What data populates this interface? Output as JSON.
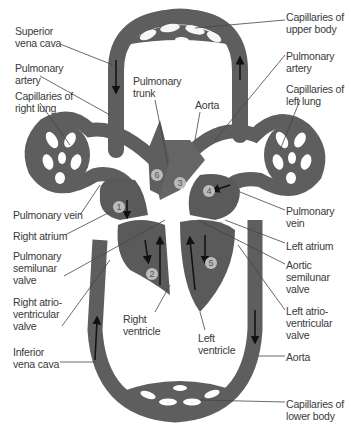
{
  "diagram": {
    "colors": {
      "vessel": "#5e5e5e",
      "vessel_outline": "#3e3e3e",
      "heart": "#5a5a5a",
      "background": "#ffffff",
      "label_text": "#3a3a3a",
      "leader_line": "#444444"
    },
    "labels_left": [
      {
        "id": "superior-vena-cava",
        "text": "Superior\nvena cava"
      },
      {
        "id": "pulmonary-artery-right",
        "text": "Pulmonary\nartery"
      },
      {
        "id": "capillaries-right-lung",
        "text": "Capillaries of\nright lung"
      },
      {
        "id": "pulmonary-vein-right",
        "text": "Pulmonary vein"
      },
      {
        "id": "right-atrium",
        "text": "Right atrium"
      },
      {
        "id": "pulmonary-semilunar-valve",
        "text": "Pulmonary\nsemilunar\nvalve"
      },
      {
        "id": "right-av-valve",
        "text": "Right atrio-\nventricular\nvalve"
      },
      {
        "id": "inferior-vena-cava",
        "text": "Inferior\nvena cava"
      }
    ],
    "labels_right": [
      {
        "id": "capillaries-upper-body",
        "text": "Capillaries of\nupper body"
      },
      {
        "id": "pulmonary-artery-left",
        "text": "Pulmonary\nartery"
      },
      {
        "id": "capillaries-left-lung",
        "text": "Capillaries of\nleft lung"
      },
      {
        "id": "pulmonary-vein-left",
        "text": "Pulmonary\nvein"
      },
      {
        "id": "left-atrium",
        "text": "Left atrium"
      },
      {
        "id": "aortic-semilunar-valve",
        "text": "Aortic\nsemilunar\nvalve"
      },
      {
        "id": "left-av-valve",
        "text": "Left atrio-\nventricular\nvalve"
      },
      {
        "id": "aorta-lower",
        "text": "Aorta"
      },
      {
        "id": "capillaries-lower-body",
        "text": "Capillaries of\nlower body"
      }
    ],
    "labels_inner": [
      {
        "id": "pulmonary-trunk",
        "text": "Pulmonary\ntrunk"
      },
      {
        "id": "aorta-upper",
        "text": "Aorta"
      },
      {
        "id": "right-ventricle",
        "text": "Right\nventricle"
      },
      {
        "id": "left-ventricle",
        "text": "Left\nventricle"
      }
    ],
    "numbered_markers": [
      "1",
      "2",
      "3",
      "4",
      "5",
      "6"
    ]
  }
}
